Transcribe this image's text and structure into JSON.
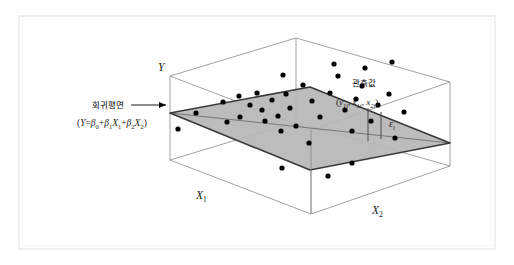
{
  "figure": {
    "title_alt": "Multiple regression plane with observed scatter points",
    "background_color": "#ffffff",
    "frame_color": "#f0f0f0"
  },
  "axes": {
    "y_label": "Y",
    "x1_label_base": "X",
    "x1_label_sub": "1",
    "x2_label_base": "X",
    "x2_label_sub": "2"
  },
  "annotations": {
    "plane_label": "회귀평면",
    "plane_equation_prefix": "(",
    "plane_equation_y": "Y",
    "plane_equation_eq": "=",
    "plane_equation_b0": "β",
    "plane_equation_b0_sub": "0",
    "plane_equation_plus1": "+",
    "plane_equation_b1": "β",
    "plane_equation_b1_sub": "1",
    "plane_equation_x1": "X",
    "plane_equation_x1_sub": "1",
    "plane_equation_plus2": "+",
    "plane_equation_b2": "β",
    "plane_equation_b2_sub": "2",
    "plane_equation_x2": "X",
    "plane_equation_x2_sub": "2",
    "plane_equation_suffix": ")",
    "observed_label": "관측값",
    "observed_point_open": "(",
    "observed_y": "y",
    "observed_y_sub": "1i",
    "observed_comma1": ", ",
    "observed_x1": "x",
    "observed_x1_sub": "1i",
    "observed_comma2": ", ",
    "observed_x2": "x",
    "observed_x2_sub": "2i",
    "observed_point_close": ")",
    "residual_label": "ε",
    "residual_label_sub": "i"
  },
  "chart_data": {
    "type": "scatter",
    "title": "",
    "xlabel": "X1 / X2",
    "ylabel": "Y",
    "grid": false,
    "legend": "none",
    "plane": {
      "fill_color": "#b6b6b6",
      "edge_color": "#3a3a3a",
      "vertices": [
        [
          170,
          113
        ],
        [
          310,
          87
        ],
        [
          450,
          143
        ],
        [
          310,
          170
        ]
      ]
    },
    "box": {
      "edge_color": "#8a8a8a",
      "top_face": [
        [
          170,
          76
        ],
        [
          296,
          38
        ],
        [
          450,
          82
        ],
        [
          311,
          130
        ]
      ],
      "bottom_face": [
        [
          170,
          160
        ],
        [
          296,
          122
        ],
        [
          450,
          166
        ],
        [
          311,
          214
        ]
      ],
      "vertical_edges": [
        [
          [
            170,
            76
          ],
          [
            170,
            160
          ]
        ],
        [
          [
            296,
            38
          ],
          [
            296,
            122
          ]
        ],
        [
          [
            450,
            82
          ],
          [
            450,
            166
          ]
        ],
        [
          [
            311,
            130
          ],
          [
            311,
            214
          ]
        ]
      ]
    },
    "points": [
      [
        196,
        113
      ],
      [
        223,
        102
      ],
      [
        227,
        122
      ],
      [
        239,
        96
      ],
      [
        240,
        117
      ],
      [
        250,
        105
      ],
      [
        257,
        93
      ],
      [
        262,
        110
      ],
      [
        265,
        121
      ],
      [
        272,
        100
      ],
      [
        278,
        116
      ],
      [
        281,
        131
      ],
      [
        286,
        94
      ],
      [
        290,
        108
      ],
      [
        296,
        126
      ],
      [
        283,
        75
      ],
      [
        303,
        85
      ],
      [
        312,
        101
      ],
      [
        320,
        117
      ],
      [
        309,
        143
      ],
      [
        330,
        93
      ],
      [
        338,
        76
      ],
      [
        345,
        110
      ],
      [
        352,
        131
      ],
      [
        356,
        99
      ],
      [
        362,
        86
      ],
      [
        371,
        121
      ],
      [
        378,
        105
      ],
      [
        389,
        94
      ],
      [
        395,
        138
      ],
      [
        352,
        163
      ],
      [
        328,
        176
      ],
      [
        282,
        168
      ],
      [
        178,
        129
      ],
      [
        365,
        68
      ],
      [
        392,
        62
      ],
      [
        334,
        64
      ],
      [
        404,
        112
      ]
    ],
    "point_color": "#000000",
    "point_radius": 2.6,
    "residual_bars": [
      {
        "x": 368,
        "y_top": 108,
        "y_bottom": 141
      },
      {
        "x": 381,
        "y_top": 112,
        "y_bottom": 139
      }
    ]
  }
}
